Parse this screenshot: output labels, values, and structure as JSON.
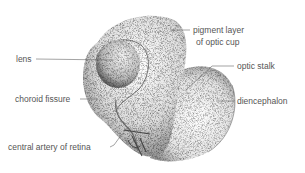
{
  "diagram": {
    "labels": {
      "lens": "lens",
      "choroid_fissure": "choroid fissure",
      "central_artery": "central artery of retina",
      "pigment_line1": "pigment layer",
      "pigment_line2": "of optic cup",
      "optic_stalk": "optic stalk",
      "diencephalon": "diencephalon"
    },
    "colors": {
      "ink": "#3a3a3a",
      "text": "#555555",
      "leader": "#666666",
      "background": "#ffffff"
    }
  }
}
